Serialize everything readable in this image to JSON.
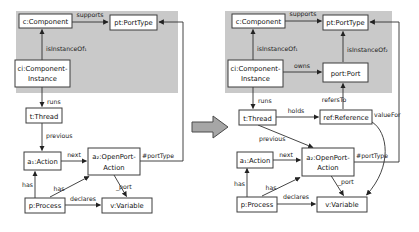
{
  "colors": {
    "region": "#c9c9c9",
    "box_fill": "#ffffff",
    "line": "#303030",
    "big_arrow_fill": "#a6a6a6",
    "big_arrow_stroke": "#4a4a4a"
  },
  "left": {
    "nodes": {
      "component": "c:Component",
      "porttype": "pt:PortType",
      "instance_l1": "ci:Component-",
      "instance_l2": "Instance",
      "thread": "t:Thread",
      "action": "a₁:Action",
      "openport_l1": "a₂:OpenPort-",
      "openport_l2": "Action",
      "process": "p:Process",
      "variable": "v:Variable"
    },
    "edges": {
      "supports": "supports",
      "isinstanceof1": "isInstanceOf₁",
      "runs": "runs",
      "previous": "previous",
      "next": "next",
      "porttype_ref": "#portType",
      "port_ref": "_port",
      "has_a1": "has",
      "has_a2": "has",
      "declares": "declares"
    }
  },
  "right": {
    "nodes": {
      "component": "c:Component",
      "porttype": "pt:PortType",
      "instance_l1": "ci:Component-",
      "instance_l2": "Instance",
      "port": "port:Port",
      "thread": "t:Thread",
      "reference": "ref:Reference",
      "action": "a₁:Action",
      "openport_l1": "a₂:OpenPort-",
      "openport_l2": "Action",
      "process": "p:Process",
      "variable": "v:Variable"
    },
    "edges": {
      "supports": "supports",
      "isinstanceof1": "isInstanceOf₁",
      "isinstanceof2": "isInstanceOf₂",
      "owns": "owns",
      "runs": "runs",
      "refersto": "refersTo",
      "holds": "holds",
      "valuefor": "valueFor",
      "previous": "previous",
      "next": "next",
      "porttype_ref": "#portType",
      "port_ref": "_port",
      "has_a1": "has",
      "has_a2": "has",
      "declares": "declares"
    }
  }
}
